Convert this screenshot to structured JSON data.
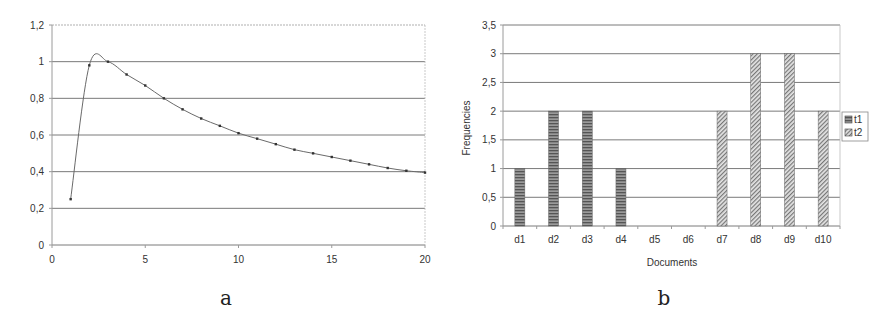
{
  "chart_data": [
    {
      "type": "line",
      "panel_label": "a",
      "title": "",
      "xlabel": "",
      "ylabel": "",
      "xlim": [
        0,
        20
      ],
      "ylim": [
        0,
        1.2
      ],
      "x_ticks": [
        "0",
        "5",
        "10",
        "15",
        "20"
      ],
      "y_ticks": [
        "0",
        "0,2",
        "0,4",
        "0,6",
        "0,8",
        "1",
        "1,2"
      ],
      "grid": "horizontal",
      "legend": null,
      "x": [
        1,
        2,
        3,
        4,
        5,
        6,
        7,
        8,
        9,
        10,
        11,
        12,
        13,
        14,
        15,
        16,
        17,
        18,
        19,
        20
      ],
      "series": [
        {
          "name": "",
          "values": [
            0.25,
            0.98,
            1.0,
            0.93,
            0.87,
            0.8,
            0.74,
            0.69,
            0.65,
            0.61,
            0.58,
            0.55,
            0.52,
            0.5,
            0.48,
            0.46,
            0.44,
            0.42,
            0.405,
            0.395
          ]
        }
      ]
    },
    {
      "type": "bar",
      "panel_label": "b",
      "title": "",
      "xlabel": "Documents",
      "ylabel": "Frequencies",
      "ylim": [
        0,
        3.5
      ],
      "y_ticks": [
        "0",
        "0,5",
        "1",
        "1,5",
        "2",
        "2,5",
        "3",
        "3,5"
      ],
      "grid": "horizontal",
      "legend_position": "right",
      "categories": [
        "d1",
        "d2",
        "d3",
        "d4",
        "d5",
        "d6",
        "d7",
        "d8",
        "d9",
        "d10"
      ],
      "series": [
        {
          "name": "t1",
          "pattern": "horizontal-stripes",
          "values": [
            1,
            2,
            2,
            1,
            0,
            0,
            0,
            0,
            0,
            0
          ]
        },
        {
          "name": "t2",
          "pattern": "diagonal-hatch",
          "values": [
            0,
            0,
            0,
            0,
            0,
            0,
            2,
            3,
            3,
            2
          ]
        }
      ]
    }
  ],
  "captions": {
    "a": "a",
    "b": "b"
  },
  "colors": {
    "grid": "#7a7a7a",
    "axis": "#9a9a9a",
    "line": "#666666",
    "bar_t1": "#777777",
    "bar_t2": "#aaaaaa"
  }
}
